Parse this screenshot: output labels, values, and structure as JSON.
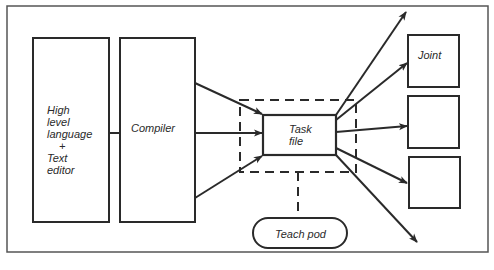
{
  "diagram": {
    "nodes": {
      "source": {
        "lines": [
          "High",
          "level",
          "language",
          "+",
          "Text",
          "editor"
        ]
      },
      "compiler": {
        "label": "Compiler"
      },
      "task_file": {
        "lines": [
          "Task",
          "file"
        ]
      },
      "joint_1": {
        "label": "Joint"
      },
      "joint_2": {
        "label": ""
      },
      "joint_3": {
        "label": ""
      },
      "teach_pod": {
        "label": "Teach pod"
      }
    },
    "edges": [
      {
        "from": "compiler",
        "to": "task_file",
        "count": 3,
        "style": "arrow"
      },
      {
        "from": "task_file",
        "to": "off-page-top",
        "style": "arrow"
      },
      {
        "from": "task_file",
        "to": "joint_1",
        "style": "arrow"
      },
      {
        "from": "task_file",
        "to": "joint_2",
        "style": "arrow"
      },
      {
        "from": "task_file",
        "to": "joint_3",
        "style": "arrow"
      },
      {
        "from": "task_file",
        "to": "off-page-bottom",
        "style": "arrow"
      },
      {
        "from": "teach_pod",
        "to": "task_file-group",
        "style": "dashed"
      }
    ],
    "colors": {
      "stroke": "#2a2a2a",
      "background": "#ffffff"
    }
  }
}
